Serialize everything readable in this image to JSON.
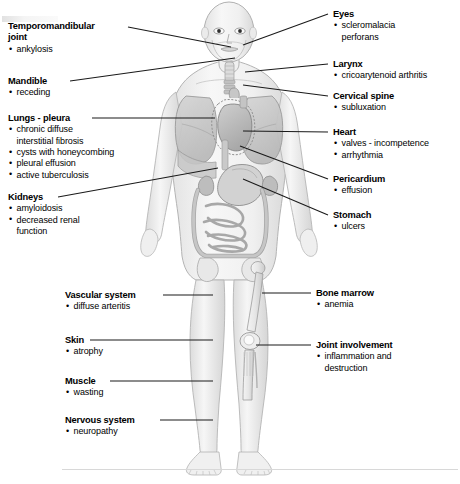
{
  "diagram": {
    "figure_parts": [
      "head",
      "eyes",
      "mandible",
      "temporomandibular-joint",
      "larynx",
      "cervical-spine",
      "lungs",
      "heart",
      "pericardium",
      "stomach",
      "intestines",
      "kidneys",
      "femur",
      "knee-joint",
      "tibia",
      "arms",
      "hands",
      "feet"
    ],
    "baseline_visible": true
  },
  "labels_left": [
    {
      "name": "temporomandibular-joint",
      "heading": "Temporomandibular\njoint",
      "bullets": [
        "ankylosis"
      ],
      "x": 8,
      "y": 21,
      "indented": false
    },
    {
      "name": "mandible",
      "heading": "Mandible",
      "bullets": [
        "receding"
      ],
      "x": 8,
      "y": 76,
      "indented": false
    },
    {
      "name": "lungs-pleura",
      "heading": "Lungs - pleura",
      "bullets": [
        "chronic diffuse\ninterstitial fibrosis",
        "cysts with honeycombing",
        "pleural effusion",
        "active tuberculosis"
      ],
      "x": 8,
      "y": 114,
      "indented": false
    },
    {
      "name": "kidneys",
      "heading": "Kidneys",
      "bullets": [
        "amyloidosis",
        "decreased renal\nfunction"
      ],
      "x": 8,
      "y": 193,
      "indented": false
    },
    {
      "name": "vascular-system",
      "heading": "Vascular system",
      "bullets": [
        "diffuse arteritis"
      ],
      "x": 65,
      "y": 291,
      "indented": true
    },
    {
      "name": "skin",
      "heading": "Skin",
      "bullets": [
        "atrophy"
      ],
      "x": 65,
      "y": 336,
      "indented": true
    },
    {
      "name": "muscle",
      "heading": "Muscle",
      "bullets": [
        "wasting"
      ],
      "x": 65,
      "y": 377,
      "indented": true
    },
    {
      "name": "nervous-system",
      "heading": "Nervous system",
      "bullets": [
        "neuropathy"
      ],
      "x": 65,
      "y": 416,
      "indented": true
    }
  ],
  "labels_right": [
    {
      "name": "eyes",
      "heading": "Eyes",
      "bullets": [
        "scleromalacia\nperforans"
      ],
      "x": 333,
      "y": 10
    },
    {
      "name": "larynx",
      "heading": "Larynx",
      "bullets": [
        "cricoarytenoid arthritis"
      ],
      "x": 333,
      "y": 60
    },
    {
      "name": "cervical-spine",
      "heading": "Cervical spine",
      "bullets": [
        "subluxation"
      ],
      "x": 333,
      "y": 92
    },
    {
      "name": "heart",
      "heading": "Heart",
      "bullets": [
        "valves - incompetence",
        "arrhythmia"
      ],
      "x": 333,
      "y": 128
    },
    {
      "name": "pericardium",
      "heading": "Pericardium",
      "bullets": [
        "effusion"
      ],
      "x": 333,
      "y": 175
    },
    {
      "name": "stomach",
      "heading": "Stomach",
      "bullets": [
        "ulcers"
      ],
      "x": 333,
      "y": 211
    },
    {
      "name": "bone-marrow",
      "heading": "Bone marrow",
      "bullets": [
        "anemia"
      ],
      "x": 316,
      "y": 289
    },
    {
      "name": "joint-involvement",
      "heading": "Joint involvement",
      "bullets": [
        "inflammation and\ndestruction"
      ],
      "x": 316,
      "y": 341
    }
  ],
  "leader_lines": [
    {
      "from": "temporomandibular-joint",
      "to": "jaw-joint",
      "x1": 128,
      "y1": 27,
      "x2": 231,
      "y2": 47
    },
    {
      "from": "mandible",
      "to": "chin",
      "x1": 70,
      "y1": 81,
      "x2": 235,
      "y2": 58
    },
    {
      "from": "lungs-pleura",
      "to": "left-lung",
      "x1": 92,
      "y1": 118,
      "x2": 215,
      "y2": 118
    },
    {
      "from": "kidneys",
      "to": "kidney-region",
      "x1": 58,
      "y1": 197,
      "x2": 218,
      "y2": 168
    },
    {
      "from": "vascular-system",
      "to": "thigh",
      "x1": 163,
      "y1": 295,
      "x2": 213,
      "y2": 295
    },
    {
      "from": "skin",
      "to": "knee-skin",
      "x1": 90,
      "y1": 340,
      "x2": 213,
      "y2": 340
    },
    {
      "from": "muscle",
      "to": "calf",
      "x1": 110,
      "y1": 381,
      "x2": 213,
      "y2": 381
    },
    {
      "from": "nervous-system",
      "to": "lower-leg",
      "x1": 160,
      "y1": 420,
      "x2": 213,
      "y2": 420
    },
    {
      "from": "eyes",
      "to": "eye",
      "x1": 328,
      "y1": 14,
      "x2": 243,
      "y2": 45
    },
    {
      "from": "larynx",
      "to": "larynx-throat",
      "x1": 328,
      "y1": 64,
      "x2": 245,
      "y2": 72
    },
    {
      "from": "cervical-spine",
      "to": "neck-spine",
      "x1": 328,
      "y1": 96,
      "x2": 243,
      "y2": 85
    },
    {
      "from": "heart",
      "to": "heart-organ",
      "x1": 328,
      "y1": 132,
      "x2": 243,
      "y2": 131
    },
    {
      "from": "pericardium",
      "to": "pericardium-sac",
      "x1": 328,
      "y1": 179,
      "x2": 240,
      "y2": 146
    },
    {
      "from": "stomach",
      "to": "stomach-organ",
      "x1": 328,
      "y1": 215,
      "x2": 243,
      "y2": 179
    },
    {
      "from": "bone-marrow",
      "to": "femur",
      "x1": 311,
      "y1": 293,
      "x2": 262,
      "y2": 293
    },
    {
      "from": "joint-involvement",
      "to": "knee-joint",
      "x1": 311,
      "y1": 345,
      "x2": 256,
      "y2": 345
    }
  ],
  "palette": {
    "background": "#ffffff",
    "text": "#000000",
    "leader_line": "#1a1a1a",
    "body_fill": "#f2f2f2",
    "body_outline": "#b0b0b0",
    "organ_light": "#dcdcdc",
    "organ_mid": "#c2c2c2",
    "organ_dark": "#a6a6a6",
    "bone": "#eeeeee",
    "baseline": "#d8d8d8"
  }
}
